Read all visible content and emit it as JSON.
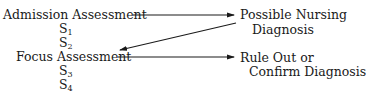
{
  "diagram": {
    "nodes": {
      "admission": "Admission Assessment",
      "s1": {
        "letter": "S",
        "sub": "1"
      },
      "s2": {
        "letter": "S",
        "sub": "2"
      },
      "focus": "Focus Assessment",
      "s3": {
        "letter": "S",
        "sub": "3"
      },
      "s4": {
        "letter": "S",
        "sub": "4"
      },
      "possible_line1": "Possible Nursing",
      "possible_line2": "Diagnosis",
      "ruleout_line1": "Rule Out or",
      "ruleout_line2": "Confirm Diagnosis"
    },
    "edges": [
      {
        "from": "Admission Assessment",
        "to": "Possible Nursing Diagnosis"
      },
      {
        "from": "Possible Nursing Diagnosis",
        "to": "Focus Assessment"
      },
      {
        "from": "Focus Assessment",
        "to": "Rule Out or Confirm Diagnosis"
      }
    ],
    "line_color": "#1a1a1a"
  }
}
